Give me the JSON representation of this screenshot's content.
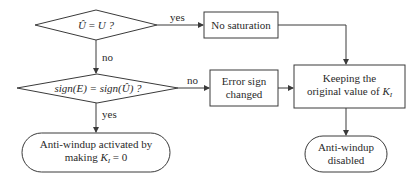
{
  "diagram": {
    "type": "flowchart",
    "nodes": [
      {
        "id": "d1",
        "shape": "diamond",
        "text_lhs": "Û",
        "text_op": " = ",
        "text_rhs": "U ?"
      },
      {
        "id": "d2",
        "shape": "diamond",
        "text": "sign(E) = sign(Û) ?"
      },
      {
        "id": "b1",
        "shape": "rectangle",
        "text": "No saturation"
      },
      {
        "id": "b2",
        "shape": "rectangle",
        "line1": "Error sign",
        "line2": "changed"
      },
      {
        "id": "b3",
        "shape": "rectangle",
        "line1": "Keeping the",
        "line2_prefix": "original value of ",
        "line2_var": "K",
        "line2_sub": "I"
      },
      {
        "id": "t1",
        "shape": "terminal",
        "line1": "Anti-windup activated by",
        "line2_prefix": "making ",
        "line2_var": "K",
        "line2_sub": "I",
        "line2_suffix": " = 0"
      },
      {
        "id": "t2",
        "shape": "terminal",
        "line1": "Anti-windup",
        "line2": "disabled"
      }
    ],
    "edges": [
      {
        "from": "d1",
        "to": "b1",
        "label": "yes"
      },
      {
        "from": "d1",
        "to": "d2",
        "label": "no"
      },
      {
        "from": "d2",
        "to": "b2",
        "label": "no"
      },
      {
        "from": "d2",
        "to": "t1",
        "label": "yes"
      },
      {
        "from": "b1",
        "to": "b3",
        "label": ""
      },
      {
        "from": "b2",
        "to": "b3",
        "label": ""
      },
      {
        "from": "b3",
        "to": "t2",
        "label": ""
      }
    ],
    "stroke_color": "#3a3a3a"
  }
}
